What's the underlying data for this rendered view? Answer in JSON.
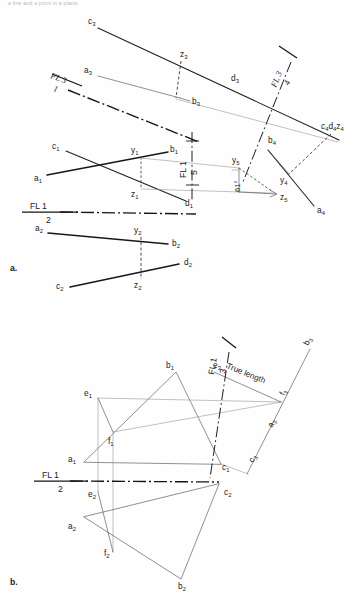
{
  "page": {
    "header_caption": "a line and a point in a plane.",
    "background": "#fefefe",
    "ink": "#1a1a1a"
  },
  "figures": [
    {
      "id": "fig-a",
      "caption": "a.",
      "caption_pos": {
        "x": 10,
        "y": 268
      },
      "reference_lines": [
        {
          "name": "fl-3-1",
          "top": "FL 3",
          "bottom": "1"
        },
        {
          "name": "fl-3-4",
          "top": "FL 3",
          "bottom": "4"
        },
        {
          "name": "fl-1-5",
          "top": "FL 1",
          "bottom": "5"
        },
        {
          "name": "fl-1-2",
          "top": "FL 1",
          "bottom": "2"
        }
      ],
      "annotations": [
        {
          "name": "angle-61",
          "text": "61°"
        }
      ],
      "point_labels": [
        {
          "id": "c3",
          "base": "c",
          "sub": "3",
          "x": 88,
          "y": 24
        },
        {
          "id": "z3",
          "base": "z",
          "sub": "3",
          "x": 186,
          "y": 56
        },
        {
          "id": "d3",
          "base": "d",
          "sub": "3",
          "x": 233,
          "y": 80
        },
        {
          "id": "a3",
          "base": "a",
          "sub": "3",
          "x": 85,
          "y": 72
        },
        {
          "id": "b3",
          "base": "b",
          "sub": "3",
          "x": 193,
          "y": 100
        },
        {
          "id": "c4d4z4",
          "base": "c₄d₄z₄",
          "sub": "",
          "x": 322,
          "y": 128
        },
        {
          "id": "b4",
          "base": "b",
          "sub": "4",
          "x": 272,
          "y": 141
        },
        {
          "id": "y4",
          "base": "y",
          "sub": "4",
          "x": 278,
          "y": 170
        },
        {
          "id": "a4",
          "base": "a",
          "sub": "4",
          "x": 320,
          "y": 210
        },
        {
          "id": "c1",
          "base": "c",
          "sub": "1",
          "x": 57,
          "y": 146
        },
        {
          "id": "y1",
          "base": "y",
          "sub": "1",
          "x": 133,
          "y": 152
        },
        {
          "id": "b1",
          "base": "b",
          "sub": "1",
          "x": 173,
          "y": 151
        },
        {
          "id": "a1",
          "base": "a",
          "sub": "1",
          "x": 36,
          "y": 179
        },
        {
          "id": "z1",
          "base": "z",
          "sub": "1",
          "x": 133,
          "y": 192
        },
        {
          "id": "y5",
          "base": "y",
          "sub": "5",
          "x": 234,
          "y": 160
        },
        {
          "id": "z5",
          "base": "z",
          "sub": "5",
          "x": 278,
          "y": 197
        },
        {
          "id": "d1",
          "base": "d",
          "sub": "1",
          "x": 187,
          "y": 203
        },
        {
          "id": "a2",
          "base": "a",
          "sub": "2",
          "x": 38,
          "y": 228
        },
        {
          "id": "y2",
          "base": "y",
          "sub": "2",
          "x": 136,
          "y": 230
        },
        {
          "id": "b2",
          "base": "b",
          "sub": "2",
          "x": 174,
          "y": 240
        },
        {
          "id": "d2",
          "base": "d",
          "sub": "2",
          "x": 186,
          "y": 265
        },
        {
          "id": "z2",
          "base": "z",
          "sub": "2",
          "x": 135,
          "y": 282
        },
        {
          "id": "c2",
          "base": "c",
          "sub": "2",
          "x": 58,
          "y": 284
        }
      ]
    },
    {
      "id": "fig-b",
      "caption": "b.",
      "caption_pos": {
        "x": 10,
        "y": 582
      },
      "reference_lines": [
        {
          "name": "fl-1-3",
          "top": "FL 1",
          "bottom": "3"
        },
        {
          "name": "fl-1-2",
          "top": "FL 1",
          "bottom": "2"
        }
      ],
      "annotations": [
        {
          "name": "true-length",
          "text": "True length"
        }
      ],
      "point_labels": [
        {
          "id": "b1",
          "base": "b",
          "sub": "1",
          "x": 169,
          "y": 366
        },
        {
          "id": "e3",
          "base": "e",
          "sub": "3",
          "x": 218,
          "y": 365
        },
        {
          "id": "b3",
          "base": "b",
          "sub": "3",
          "x": 312,
          "y": 342
        },
        {
          "id": "e1",
          "base": "e",
          "sub": "1",
          "x": 87,
          "y": 394
        },
        {
          "id": "f3",
          "base": "f",
          "sub": "3",
          "x": 287,
          "y": 398
        },
        {
          "id": "a3",
          "base": "a",
          "sub": "3",
          "x": 276,
          "y": 427
        },
        {
          "id": "f1",
          "base": "f",
          "sub": "1",
          "x": 111,
          "y": 440
        },
        {
          "id": "c3",
          "base": "c",
          "sub": "3",
          "x": 256,
          "y": 461
        },
        {
          "id": "a1",
          "base": "a",
          "sub": "1",
          "x": 72,
          "y": 458
        },
        {
          "id": "c1",
          "base": "c",
          "sub": "1",
          "x": 222,
          "y": 471
        },
        {
          "id": "c2",
          "base": "c",
          "sub": "2",
          "x": 226,
          "y": 494
        },
        {
          "id": "e2",
          "base": "e",
          "sub": "2",
          "x": 90,
          "y": 493
        },
        {
          "id": "a2",
          "base": "a",
          "sub": "2",
          "x": 72,
          "y": 527
        },
        {
          "id": "f2",
          "base": "f",
          "sub": "2",
          "x": 107,
          "y": 549
        },
        {
          "id": "b2",
          "base": "b",
          "sub": "2",
          "x": 182,
          "y": 586
        }
      ]
    }
  ],
  "geometry": {
    "fig_a": {
      "line_c3_d4": [
        [
          98,
          28
        ],
        [
          339,
          140
        ]
      ],
      "line_a3_b3": [
        [
          98,
          76
        ],
        [
          187,
          98
        ]
      ],
      "line_b3_d4": [
        [
          175,
          98
        ],
        [
          339,
          141
        ]
      ],
      "dashed_z3_b3": [
        [
          180,
          60
        ],
        [
          176,
          98
        ]
      ],
      "center_fl31": [
        [
          68,
          89
        ],
        [
          197,
          141
        ]
      ],
      "center_fl34": [
        [
          289,
          60
        ],
        [
          246,
          180
        ]
      ],
      "line_b4_a4": [
        [
          270,
          151
        ],
        [
          313,
          205
        ]
      ],
      "line_b4_y4": [
        [
          268,
          150
        ],
        [
          290,
          175
        ]
      ],
      "dashed_c4_y4": [
        [
          330,
          134
        ],
        [
          288,
          175
        ]
      ],
      "line_a1_b1": [
        [
          47,
          174
        ],
        [
          168,
          152
        ]
      ],
      "line_c1_d1": [
        [
          66,
          150
        ],
        [
          184,
          200
        ]
      ],
      "dashed_y1_z1": [
        [
          141,
          157
        ],
        [
          141,
          188
        ]
      ],
      "line_y1_y5": [
        [
          141,
          157
        ],
        [
          238,
          168
        ]
      ],
      "line_z1_z5": [
        [
          141,
          188
        ],
        [
          273,
          193
        ]
      ],
      "center_fl15": [
        [
          192,
          133
        ],
        [
          192,
          200
        ]
      ],
      "tick_fl15_top": [
        [
          186,
          140
        ],
        [
          198,
          140
        ]
      ],
      "tick_fl15_bot": [
        [
          186,
          185
        ],
        [
          198,
          185
        ]
      ],
      "dashed_y5_z5": [
        [
          238,
          168
        ],
        [
          272,
          193
        ]
      ],
      "ref_fl12": [
        [
          22,
          211
        ],
        [
          196,
          213
        ]
      ],
      "center_fl12": [
        [
          72,
          212
        ],
        [
          196,
          213
        ]
      ],
      "line_a2_b2": [
        [
          48,
          232
        ],
        [
          168,
          243
        ]
      ],
      "line_c2_d2": [
        [
          70,
          286
        ],
        [
          178,
          264
        ]
      ],
      "dashed_y2_z2": [
        [
          141,
          236
        ],
        [
          141,
          278
        ]
      ]
    },
    "fig_b": {
      "tri1_a1_b1_c1": [
        [
          84,
          462
        ],
        [
          176,
          372
        ],
        [
          221,
          464
        ]
      ],
      "seg_e1_f1": [
        [
          98,
          398
        ],
        [
          113,
          432
        ]
      ],
      "seg_e1_f3line": [
        [
          98,
          398
        ],
        [
          279,
          402
        ]
      ],
      "seg_f1_f3line": [
        [
          113,
          432
        ],
        [
          279,
          402
        ]
      ],
      "seg_e3_f3": [
        [
          214,
          371
        ],
        [
          279,
          402
        ]
      ],
      "center_fl13": [
        [
          228,
          352
        ],
        [
          210,
          476
        ]
      ],
      "tri2_a2_b2_c2": [
        [
          84,
          516
        ],
        [
          181,
          578
        ],
        [
          219,
          482
        ]
      ],
      "seg_e2_f2": [
        [
          98,
          490
        ],
        [
          113,
          551
        ]
      ],
      "vert_e1_e2": [
        [
          98,
          398
        ],
        [
          98,
          490
        ]
      ],
      "vert_f1_f2": [
        [
          113,
          432
        ],
        [
          113,
          551
        ]
      ],
      "ref_fl12": [
        [
          34,
          480
        ],
        [
          218,
          481
        ]
      ],
      "center_fl12": [
        [
          80,
          481
        ],
        [
          218,
          481
        ]
      ],
      "line_c3_b3": [
        [
          247,
          472
        ],
        [
          309,
          349
        ]
      ],
      "line_c1_c3": [
        [
          221,
          464
        ],
        [
          247,
          472
        ]
      ]
    }
  }
}
